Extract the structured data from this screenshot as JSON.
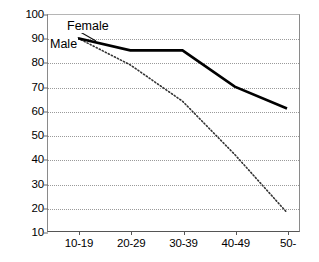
{
  "chart_data": {
    "type": "line",
    "title": "",
    "subtitle": "",
    "xlabel": "",
    "ylabel": "",
    "categories": [
      "10-19",
      "20-29",
      "30-39",
      "40-49",
      "50-"
    ],
    "series": [
      {
        "name": "Male",
        "style": "solid",
        "color": "#000000",
        "values": [
          90,
          85,
          85,
          70,
          61
        ]
      },
      {
        "name": "Female",
        "style": "dotted",
        "color": "#333333",
        "values": [
          90,
          79,
          64,
          42,
          18
        ]
      }
    ],
    "yticks": [
      10,
      20,
      30,
      40,
      50,
      60,
      70,
      80,
      90,
      100
    ],
    "ylim": [
      10,
      100
    ],
    "xlim": [
      0,
      4
    ],
    "grid": "horizontal-dotted",
    "legend": "inline-annotations",
    "annotations": [
      {
        "text": "Female",
        "points_to_series": "Female"
      },
      {
        "text": "Male",
        "points_to_series": "Male"
      }
    ]
  },
  "ytick_labels": [
    "100",
    "90",
    "80",
    "70",
    "60",
    "50",
    "40",
    "30",
    "20",
    "10"
  ],
  "xtick_labels": [
    "10-19",
    "20-29",
    "30-39",
    "40-49",
    "50-"
  ],
  "labels": {
    "female": "Female",
    "male": "Male"
  },
  "colors": {
    "male_line": "#000000",
    "female_line": "#333333",
    "grid": "#9a9a9a",
    "axis": "#555555",
    "background": "#ffffff"
  }
}
